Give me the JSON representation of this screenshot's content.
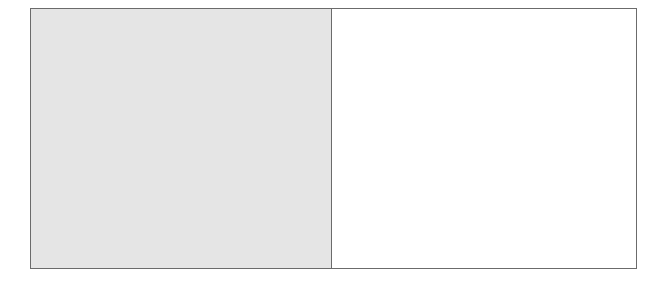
{
  "figure": {
    "panels": [
      {
        "id": "left",
        "fill": "#e5e5e5",
        "shaded": true
      },
      {
        "id": "right",
        "fill": "#ffffff",
        "shaded": false
      }
    ],
    "border_color": "#6b6b6b"
  }
}
